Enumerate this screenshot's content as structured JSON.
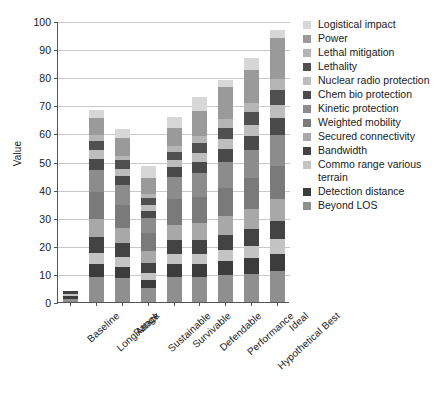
{
  "chart_data": {
    "type": "bar",
    "subtype": "stacked-bar",
    "title": "",
    "xlabel": "",
    "ylabel": "Value",
    "ylim": [
      0,
      100
    ],
    "ytick_step": 10,
    "yticks": [
      0,
      10,
      20,
      30,
      40,
      50,
      60,
      70,
      80,
      90,
      100
    ],
    "grid": true,
    "legend_position": "right",
    "categories": [
      "Baseline",
      "LongRange",
      "Attack",
      "Sustainable",
      "Survivable",
      "Defendable",
      "Performance",
      "Hypothetical Best",
      "Ideal"
    ],
    "series": [
      {
        "name": "Beyond LOS",
        "color": "#8f8f8f",
        "values": [
          1.0,
          9.0,
          8.5,
          5.0,
          9.0,
          9.0,
          9.5,
          10.0,
          11.0
        ]
      },
      {
        "name": "Detection distance",
        "color": "#3c3c3c",
        "values": [
          1.0,
          4.5,
          4.0,
          3.0,
          4.5,
          4.5,
          5.0,
          5.5,
          6.0
        ]
      },
      {
        "name": "Commo range various terrain",
        "color": "#c4c4c4",
        "values": [
          1.0,
          4.0,
          3.5,
          2.5,
          3.5,
          3.5,
          4.0,
          4.5,
          5.5
        ]
      },
      {
        "name": "Bandwidth",
        "color": "#434343",
        "values": [
          1.0,
          5.5,
          5.0,
          3.5,
          5.0,
          5.0,
          5.5,
          6.0,
          6.5
        ]
      },
      {
        "name": "Secured connectivity",
        "color": "#a8a8a8",
        "values": [
          0.0,
          6.5,
          5.5,
          4.0,
          5.5,
          6.0,
          6.5,
          7.0,
          7.5
        ]
      },
      {
        "name": "Weighted mobility",
        "color": "#7a7a7a",
        "values": [
          0.0,
          9.5,
          8.0,
          6.5,
          9.0,
          9.5,
          10.0,
          11.0,
          12.0
        ]
      },
      {
        "name": "Kinetic protection",
        "color": "#8c8c8c",
        "values": [
          0.0,
          8.0,
          7.0,
          5.5,
          8.0,
          8.5,
          9.5,
          10.0,
          11.0
        ]
      },
      {
        "name": "Chem bio protection",
        "color": "#4a4a4a",
        "values": [
          0.0,
          4.0,
          3.5,
          2.5,
          3.5,
          4.0,
          4.5,
          5.0,
          6.0
        ]
      },
      {
        "name": "Nuclear radio protection",
        "color": "#bdbdbd",
        "values": [
          0.0,
          3.0,
          2.5,
          2.0,
          2.5,
          3.0,
          3.5,
          4.0,
          4.5
        ]
      },
      {
        "name": "Lethality",
        "color": "#505050",
        "values": [
          0.0,
          3.5,
          3.0,
          2.5,
          3.0,
          3.5,
          4.0,
          4.5,
          5.5
        ]
      },
      {
        "name": "Lethal mitigation",
        "color": "#b5b5b5",
        "values": [
          0.0,
          2.0,
          1.5,
          1.5,
          2.0,
          2.5,
          3.0,
          3.5,
          4.0
        ]
      },
      {
        "name": "Power",
        "color": "#9a9a9a",
        "values": [
          0.0,
          6.0,
          6.5,
          5.5,
          6.5,
          9.0,
          11.5,
          11.5,
          14.5
        ]
      },
      {
        "name": "Logistical impact",
        "color": "#d7d7d7",
        "values": [
          0.0,
          3.0,
          3.0,
          4.5,
          4.0,
          5.0,
          2.5,
          4.5,
          3.0
        ]
      }
    ],
    "totals": [
      4.0,
      68.5,
      61.0,
      48.5,
      66.0,
      73.0,
      79.0,
      87.0,
      97.0
    ],
    "annotations": []
  },
  "legend": {
    "items": [
      "Logistical impact",
      "Power",
      "Lethal mitigation",
      "Lethality",
      "Nuclear radio protection",
      "Chem bio protection",
      "Kinetic protection",
      "Weighted mobility",
      "Secured connectivity",
      "Bandwidth",
      "Commo range various terrain",
      "Detection distance",
      "Beyond LOS"
    ],
    "colors": [
      "#d7d7d7",
      "#9a9a9a",
      "#b5b5b5",
      "#505050",
      "#bdbdbd",
      "#4a4a4a",
      "#8c8c8c",
      "#7a7a7a",
      "#a8a8a8",
      "#434343",
      "#c4c4c4",
      "#3c3c3c",
      "#8f8f8f"
    ]
  },
  "caption": {
    "text": ""
  }
}
